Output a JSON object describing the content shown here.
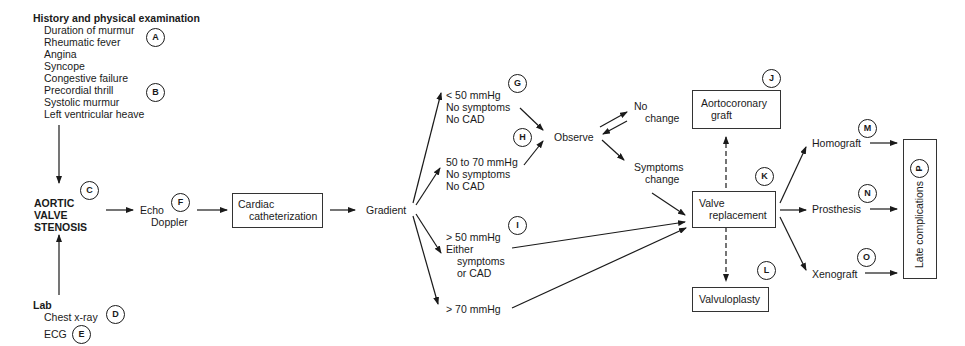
{
  "history": {
    "title": "History and physical examination",
    "items": [
      "Duration of murmur",
      "Rheumatic fever",
      "Angina",
      "Syncope",
      "Congestive failure",
      "Precordial thrill",
      "Systolic murmur",
      "Left ventricular heave"
    ]
  },
  "diagnosis": {
    "line1": "AORTIC",
    "line2": "VALVE",
    "line3": "STENOSIS"
  },
  "lab": {
    "title": "Lab",
    "items": [
      "Chest x-ray",
      "ECG"
    ]
  },
  "echo": {
    "line1": "Echo",
    "line2": "Doppler"
  },
  "cath": {
    "line1": "Cardiac",
    "line2": "catheterization"
  },
  "gradient": "Gradient",
  "branches": {
    "g": [
      "< 50 mmHg",
      "No symptoms",
      "No CAD"
    ],
    "h": [
      "50 to 70 mmHg",
      "No symptoms",
      "No CAD"
    ],
    "i": [
      "> 50 mmHg",
      "Either",
      "symptoms",
      "or CAD"
    ],
    "j70": "> 70 mmHg"
  },
  "observe": "Observe",
  "no_change": {
    "line1": "No",
    "line2": "change"
  },
  "symptoms_change": {
    "line1": "Symptoms",
    "line2": "change"
  },
  "graft": {
    "line1": "Aortocoronary",
    "line2": "graft"
  },
  "valve_replacement": {
    "line1": "Valve",
    "line2": "replacement"
  },
  "valvuloplasty": "Valvuloplasty",
  "options": [
    "Homograft",
    "Prosthesis",
    "Xenograft"
  ],
  "late": "Late complications",
  "labels": {
    "A": "A",
    "B": "B",
    "C": "C",
    "D": "D",
    "E": "E",
    "F": "F",
    "G": "G",
    "H": "H",
    "I": "I",
    "J": "J",
    "K": "K",
    "L": "L",
    "M": "M",
    "N": "N",
    "O": "O",
    "P": "P"
  }
}
